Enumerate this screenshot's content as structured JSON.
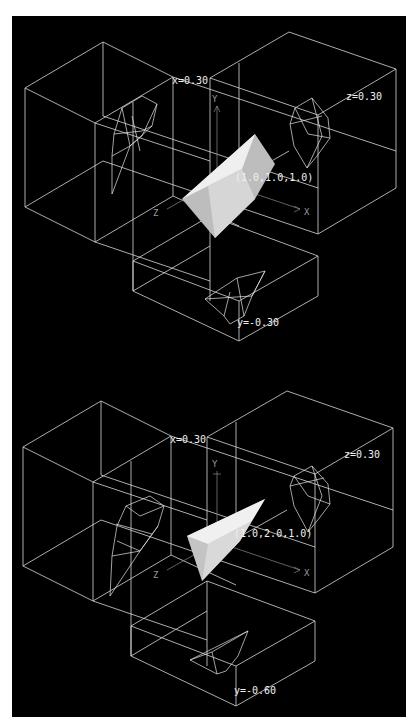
{
  "figure": {
    "background": "#000000",
    "line_color": "#d8d8d8",
    "solid_fill": "#e8e8e8",
    "caption_fragment": "",
    "panels": [
      {
        "id": "top",
        "point_label": "(1.0,1.0,1.0)",
        "slice_x_label": "x=0.30",
        "slice_z_label": "z=0.30",
        "slice_y_label": "y=-0.30",
        "axis_labels": {
          "x": "X",
          "y": "Y",
          "z": "Z"
        }
      },
      {
        "id": "bottom",
        "point_label": "(1.0,2.0,1.0)",
        "slice_x_label": "x=0.30",
        "slice_z_label": "z=0.30",
        "slice_y_label": "y=-0.60",
        "axis_labels": {
          "x": "X",
          "y": "Y",
          "z": "Z"
        }
      }
    ]
  }
}
